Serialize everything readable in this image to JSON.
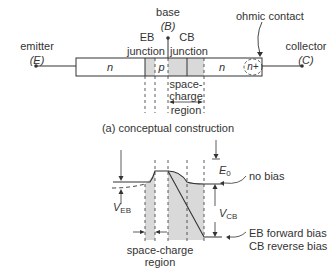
{
  "diagram": {
    "part_a": {
      "caption": "(a) conceptual construction",
      "terminals": {
        "emitter": {
          "name": "emitter",
          "symbol": "(E)"
        },
        "base": {
          "name": "base",
          "symbol": "(B)"
        },
        "collector": {
          "name": "collector",
          "symbol": "(C)"
        }
      },
      "junctions": {
        "eb_line1": "EB",
        "eb_line2": "junction",
        "cb_line1": "CB",
        "cb_line2": "junction"
      },
      "regions": {
        "emitter_region": "n",
        "base_region": "p",
        "collector_region": "n",
        "contact_region": "n+"
      },
      "ohmic_contact": "ohmic contact",
      "space_charge": [
        "space-",
        "charge",
        "region"
      ]
    },
    "part_b": {
      "labels": {
        "v_eb": "V",
        "v_eb_sub": "EB",
        "v_cb": "V",
        "v_cb_sub": "CB",
        "e0": "E",
        "e0_sub": "0",
        "no_bias": "no bias",
        "forward_1": "EB forward bias",
        "forward_2": "CB reverse bias",
        "space_charge_1": "space-charge",
        "space_charge_2": "region"
      }
    },
    "colors": {
      "line": "#333333",
      "shade": "#d9d9d9"
    }
  }
}
